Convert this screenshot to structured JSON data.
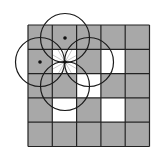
{
  "diagram": {
    "grid": {
      "rows": 5,
      "cols": 5,
      "origin": [
        28,
        25
      ],
      "cell_size": 24.3,
      "gray_color": "#a8a8a8",
      "white_color": "#ffffff",
      "line_color": "#222222",
      "white_cells": [
        [
          1,
          1
        ],
        [
          1,
          3
        ],
        [
          2,
          2
        ],
        [
          3,
          1
        ],
        [
          3,
          3
        ]
      ]
    },
    "center_point": {
      "cell": [
        1,
        1
      ],
      "x": 65,
      "y": 62
    },
    "circles": [
      {
        "name": "top",
        "cx": 65,
        "cy": 38,
        "r": 24.5,
        "dot": true
      },
      {
        "name": "left",
        "cx": 40,
        "cy": 62,
        "r": 24.5,
        "dot": true
      },
      {
        "name": "right",
        "cx": 89,
        "cy": 62,
        "r": 24.5,
        "dot": false
      },
      {
        "name": "bottom",
        "cx": 65,
        "cy": 86,
        "r": 24.5,
        "dot": false
      }
    ],
    "starburst": {
      "color": "#bbbbbb",
      "rays": 12
    }
  }
}
